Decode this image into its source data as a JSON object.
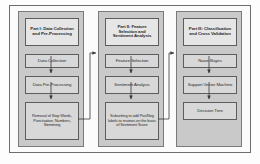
{
  "diagram": {
    "colors": {
      "panel_fill": "#c9c9c9",
      "node_fill": "#d8d8d8",
      "header_fill": "#e6e6e6",
      "border": "#5d5d5d",
      "background": "#fdfdfd"
    },
    "parts": [
      {
        "id": "part-1",
        "header": "Part I: Data Collection and Pre-Processing",
        "steps": [
          "Data Collection",
          "Data Pre-Processing",
          "Removal of Stop Words, Punctuation, Numbers, Stemming"
        ]
      },
      {
        "id": "part-2",
        "header": "Part II: Feature Selection and Sentiment Analysis",
        "steps": [
          "Feature Selection",
          "Sentiment Analysis",
          "Subsetting to add Pos/Neg labels to reviews on the basis of Sentiment Score"
        ]
      },
      {
        "id": "part-3",
        "header": "Part III: Classification and Cross Validation",
        "steps": [
          "Naive Bayes",
          "Support Vector Machine",
          "Decision Tree"
        ]
      }
    ],
    "connectors": [
      {
        "name": "part1-to-part2",
        "from": "Removal of Stop Words, Punctuation, Numbers, Stemming",
        "to": "Feature Selection"
      },
      {
        "name": "part2-to-part3",
        "from": "Subsetting to add Pos/Neg labels to reviews on the basis of Sentiment Score",
        "to": "Naive Bayes"
      }
    ]
  }
}
